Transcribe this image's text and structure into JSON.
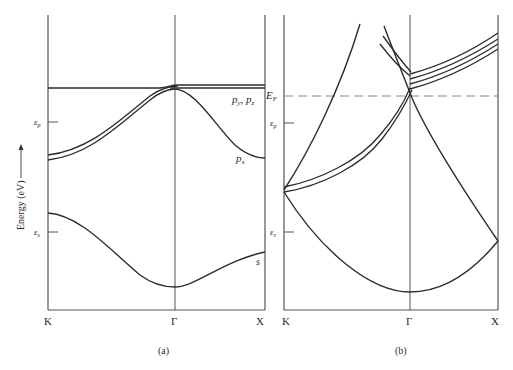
{
  "figure": {
    "y_axis_label": "Energy (eV)",
    "panels": [
      {
        "id": "a",
        "caption": "(a)",
        "x_ticks": [
          "K",
          "Γ",
          "X"
        ],
        "energy_markers": [
          {
            "label": "ε",
            "sub": "p"
          },
          {
            "label": "ε",
            "sub": "s"
          }
        ],
        "band_labels": [
          {
            "base": "p",
            "sub": "y",
            "sep": ", ",
            "base2": "p",
            "sub2": "z"
          },
          {
            "base": "p",
            "sub": "x"
          },
          {
            "base": "s"
          }
        ]
      },
      {
        "id": "b",
        "caption": "(b)",
        "x_ticks": [
          "K",
          "Γ",
          "X"
        ],
        "fermi_label": {
          "base": "E",
          "sub": "F"
        },
        "energy_markers": [
          {
            "label": "ε",
            "sub": "p"
          },
          {
            "label": "ε",
            "sub": "s"
          }
        ]
      }
    ]
  },
  "colors": {
    "line": "#2b2b2b",
    "axis": "#555555",
    "dashed": "#888888",
    "background": "#ffffff"
  }
}
